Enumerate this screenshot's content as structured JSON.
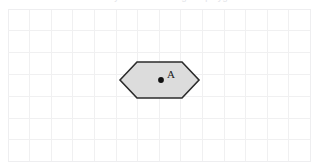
{
  "figure": {
    "title_clipped": "Geometry worksheet - regular polygon",
    "background_color": "#ffffff",
    "canvas": {
      "width": 316,
      "height": 163
    }
  },
  "grid": {
    "line_color": "#f0f0f1",
    "line_width": 1,
    "cell_width": 21.6,
    "cell_height": 21.8,
    "origin_x": 8,
    "origin_y": 9,
    "columns": 14,
    "rows": 7,
    "border_color": "#eeeef0"
  },
  "shapes": [
    {
      "name": "hexagon",
      "type": "polygon",
      "sides": 6,
      "fill_color": "#dcdcdc",
      "stroke_color": "#2b2b2b",
      "stroke_width": 1.6,
      "points": "120,80 137,62 182,62 199,80 182,98 137,98",
      "center": {
        "x": 161,
        "y": 80
      },
      "bounds": {
        "left": 120,
        "top": 62,
        "right": 199,
        "bottom": 98
      }
    }
  ],
  "points": [
    {
      "id": "center-point-a",
      "label": "A",
      "x": 161,
      "y": 80,
      "radius": 2.9,
      "color": "#111111",
      "label_x": 167,
      "label_y": 69,
      "label_color": "#1a1a1a"
    }
  ]
}
